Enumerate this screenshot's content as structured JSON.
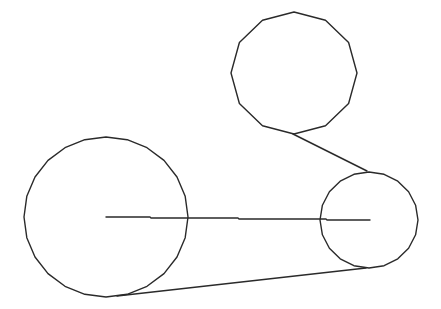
{
  "canvas": {
    "width": 441,
    "height": 309,
    "background": "#ffffff",
    "stroke_color": "#2a2a2a"
  },
  "diagram": {
    "title": "",
    "pulleys": [
      {
        "id": "large-left-pulley",
        "cx": 106,
        "cy": 217,
        "rx": 82,
        "ry": 80,
        "sides": 24,
        "rotation_deg": 0
      },
      {
        "id": "top-idler-pulley",
        "cx": 294,
        "cy": 73,
        "rx": 63,
        "ry": 61,
        "sides": 12,
        "rotation_deg": 0
      },
      {
        "id": "small-right-pulley",
        "cx": 369,
        "cy": 220,
        "rx": 49,
        "ry": 48,
        "sides": 20,
        "rotation_deg": 0
      }
    ],
    "lines": [
      {
        "id": "center-distance-line",
        "points": [
          [
            106,
            217
          ],
          [
            150,
            217
          ],
          [
            151,
            218
          ],
          [
            238,
            218
          ],
          [
            239,
            219
          ],
          [
            326,
            219
          ],
          [
            327,
            220
          ],
          [
            370,
            220
          ]
        ]
      },
      {
        "id": "upper-belt-segment",
        "points": [
          [
            293,
            134
          ],
          [
            367,
            171
          ]
        ]
      },
      {
        "id": "lower-belt-segment",
        "points": [
          [
            117,
            296
          ],
          [
            366,
            268
          ]
        ]
      }
    ]
  }
}
